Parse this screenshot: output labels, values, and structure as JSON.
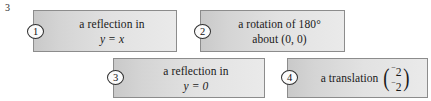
{
  "question": {
    "number": "3"
  },
  "options": [
    {
      "marker": "1",
      "line1": "a reflection in",
      "line2": "y = x"
    },
    {
      "marker": "2",
      "line1": "a rotation of 180°",
      "line2": "about (0, 0)"
    },
    {
      "marker": "3",
      "line1": "a reflection in",
      "line2": "y = 0"
    },
    {
      "marker": "4",
      "label": "a translation",
      "vector": {
        "open_paren": "(",
        "close_paren": ")",
        "top_sign": "−",
        "top_value": "2",
        "bottom_sign": "−",
        "bottom_value": "2"
      }
    }
  ],
  "colors": {
    "box_border": "#8c8c8c",
    "box_fill_left": "#c9c9c9",
    "box_fill_right": "#eaeaea",
    "text": "#1a1a1a",
    "page_background": "#ffffff"
  }
}
